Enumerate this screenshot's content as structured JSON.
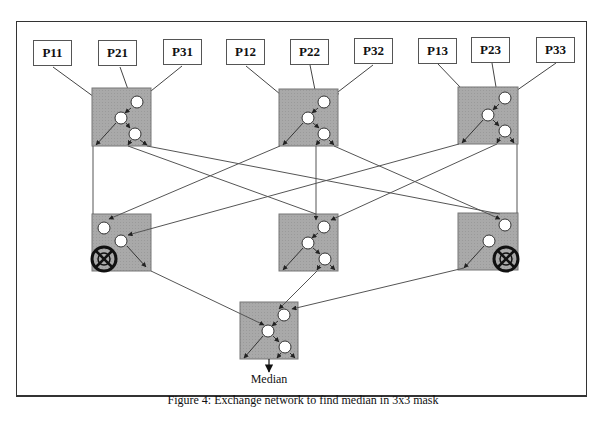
{
  "inputs": [
    {
      "id": "P11",
      "label": "P11",
      "x": 33,
      "y": 40
    },
    {
      "id": "P21",
      "label": "P21",
      "x": 98,
      "y": 40
    },
    {
      "id": "P31",
      "label": "P31",
      "x": 163,
      "y": 39
    },
    {
      "id": "P12",
      "label": "P12",
      "x": 226,
      "y": 39
    },
    {
      "id": "P22",
      "label": "P22",
      "x": 290,
      "y": 39
    },
    {
      "id": "P32",
      "label": "P32",
      "x": 354,
      "y": 38
    },
    {
      "id": "P13",
      "label": "P13",
      "x": 418,
      "y": 38
    },
    {
      "id": "P23",
      "label": "P23",
      "x": 471,
      "y": 37
    },
    {
      "id": "P33",
      "label": "P33",
      "x": 536,
      "y": 37
    }
  ],
  "nodes": {
    "top": [
      {
        "id": "A",
        "x": 92,
        "y": 88,
        "w": 59,
        "h": 58,
        "disabled": false
      },
      {
        "id": "B",
        "x": 279,
        "y": 89,
        "w": 59,
        "h": 57,
        "disabled": false
      },
      {
        "id": "C",
        "x": 458,
        "y": 87,
        "w": 60,
        "h": 57,
        "disabled": false
      }
    ],
    "middle": [
      {
        "id": "D",
        "x": 92,
        "y": 214,
        "w": 59,
        "h": 57,
        "crossed": "bottom-left"
      },
      {
        "id": "E",
        "x": 279,
        "y": 214,
        "w": 59,
        "h": 57,
        "crossed": null
      },
      {
        "id": "F",
        "x": 458,
        "y": 213,
        "w": 60,
        "h": 57,
        "crossed": "bottom-right"
      }
    ],
    "bottom": [
      {
        "id": "G",
        "x": 240,
        "y": 302,
        "w": 58,
        "h": 57,
        "crossed": null
      }
    ]
  },
  "output_label": "Median",
  "caption": "Figure 4: Exchange network to find median in 3x3 mask",
  "colors": {
    "node_fill": "#a8a8a8",
    "line": "#444444",
    "circle_fill": "#ffffff"
  }
}
